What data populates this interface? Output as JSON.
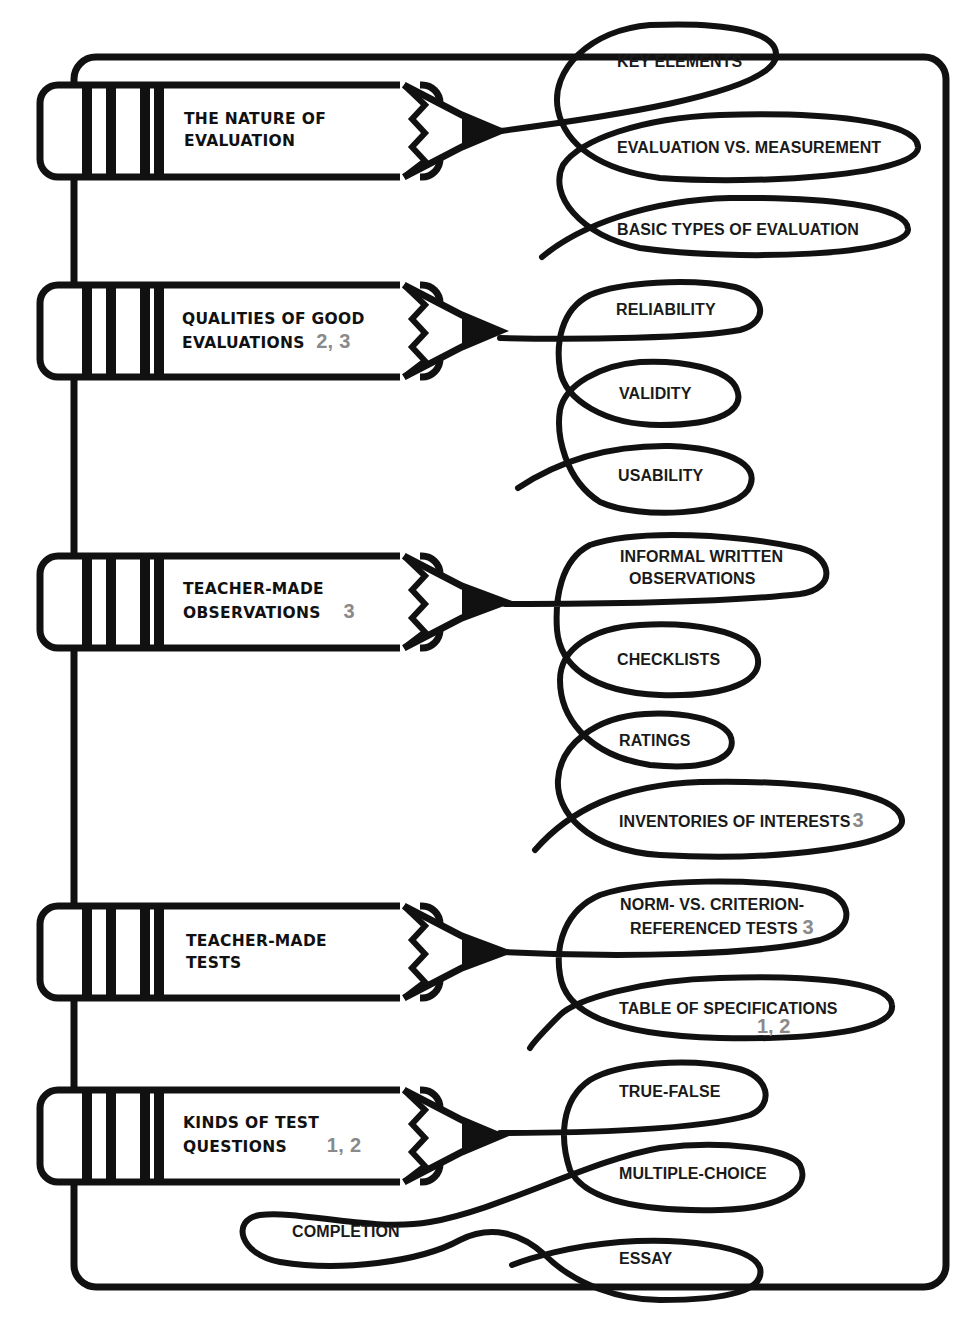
{
  "diagram": {
    "colors": {
      "ink": "#111111",
      "reference_number": "#8a8a8a",
      "background": "#ffffff"
    },
    "topics": [
      {
        "label_line1": "THE NATURE OF",
        "label_line2": "EVALUATION",
        "ref": "",
        "subtopics": [
          {
            "label": "KEY ELEMENTS",
            "ref": ""
          },
          {
            "label": "EVALUATION VS. MEASUREMENT",
            "ref": ""
          },
          {
            "label": "BASIC TYPES OF EVALUATION",
            "ref": ""
          }
        ]
      },
      {
        "label_line1": "QUALITIES OF GOOD",
        "label_line2": "EVALUATIONS",
        "ref": "2, 3",
        "subtopics": [
          {
            "label": "RELIABILITY",
            "ref": ""
          },
          {
            "label": "VALIDITY",
            "ref": ""
          },
          {
            "label": "USABILITY",
            "ref": ""
          }
        ]
      },
      {
        "label_line1": "TEACHER-MADE",
        "label_line2": "OBSERVATIONS",
        "ref": "3",
        "subtopics": [
          {
            "label_line1": "INFORMAL WRITTEN",
            "label_line2": "OBSERVATIONS",
            "ref": ""
          },
          {
            "label": "CHECKLISTS",
            "ref": ""
          },
          {
            "label": "RATINGS",
            "ref": ""
          },
          {
            "label": "INVENTORIES OF INTERESTS",
            "ref": "3"
          }
        ]
      },
      {
        "label_line1": "TEACHER-MADE",
        "label_line2": "TESTS",
        "ref": "",
        "subtopics": [
          {
            "label_line1": "NORM- VS. CRITERION-",
            "label_line2": "REFERENCED TESTS",
            "ref": "3"
          },
          {
            "label": "TABLE OF SPECIFICATIONS",
            "ref": "1, 2"
          }
        ]
      },
      {
        "label_line1": "KINDS OF TEST",
        "label_line2": "QUESTIONS",
        "ref": "1, 2",
        "subtopics": [
          {
            "label": "TRUE-FALSE",
            "ref": ""
          },
          {
            "label": "MULTIPLE-CHOICE",
            "ref": ""
          },
          {
            "label": "COMPLETION",
            "ref": ""
          },
          {
            "label": "ESSAY",
            "ref": ""
          }
        ]
      }
    ]
  }
}
